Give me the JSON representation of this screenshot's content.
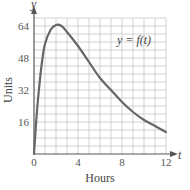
{
  "chart_data": {
    "type": "line",
    "title": "",
    "xlabel": "Hours",
    "ylabel": "Units",
    "x_axis_var": "t",
    "y_axis_var": "y",
    "curve_label": "y = f(t)",
    "xlim": [
      0,
      12
    ],
    "ylim": [
      0,
      68
    ],
    "x_ticks": [
      0,
      4,
      8,
      12
    ],
    "y_ticks": [
      16,
      32,
      48,
      64
    ],
    "x_tick_labels": [
      "0",
      "4",
      "8",
      "12"
    ],
    "y_tick_labels": [
      "16",
      "32",
      "48",
      "64"
    ],
    "grid": true,
    "grid_x_step": 1,
    "grid_y_step": 4,
    "legend": "none",
    "series": [
      {
        "name": "y = f(t)",
        "x": [
          0,
          0.25,
          0.5,
          0.75,
          1,
          1.5,
          2,
          2.5,
          3,
          4,
          5,
          6,
          7,
          8,
          9,
          10,
          11,
          12
        ],
        "values": [
          0,
          20,
          35,
          47,
          55,
          62,
          64.5,
          64,
          61,
          54,
          46,
          38,
          32,
          26,
          21,
          17,
          14,
          11
        ]
      }
    ]
  },
  "colors": {
    "curve": "#666666",
    "grid": "#c8c8c8",
    "axis": "#555555",
    "text": "#555555"
  }
}
